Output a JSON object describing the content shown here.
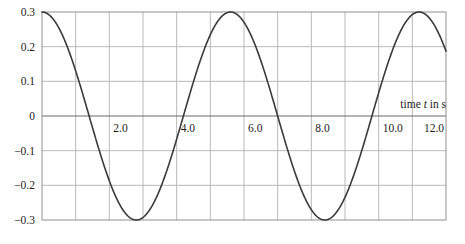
{
  "chart_data": {
    "type": "line",
    "title": "",
    "subtitle": "",
    "xlabel": "time t in s",
    "ylabel": "",
    "xlim": [
      0,
      12
    ],
    "ylim": [
      -0.3,
      0.3
    ],
    "grid": true,
    "legend": "none",
    "x_major_step": 2.0,
    "x_minor_step": 1.0,
    "y_step": 0.1,
    "zero_line": true,
    "xticks": [
      0,
      2.0,
      4.0,
      6.0,
      8.0,
      10.0,
      12.0
    ],
    "xtick_labels": [
      "",
      "2.0",
      "4.0",
      "6.0",
      "8.0",
      "10.0",
      "12.0"
    ],
    "yticks": [
      0.3,
      0.2,
      0.1,
      0,
      -0.1,
      -0.2,
      -0.3
    ],
    "ytick_labels": [
      "0.3",
      "0.2",
      "0.1",
      "0",
      "−0.1",
      "−0.2",
      "−0.3"
    ],
    "series": [
      {
        "name": "displacement",
        "form": "cosine",
        "amplitude": 0.3,
        "period": 5.6,
        "phase": 0,
        "offset": 0,
        "color": "#3a3a3a",
        "width": 1.6,
        "x": [
          0.0,
          0.2,
          0.4,
          0.6,
          0.8,
          1.0,
          1.2,
          1.4,
          1.6,
          1.8,
          2.0,
          2.2,
          2.4,
          2.6,
          2.8,
          3.0,
          3.2,
          3.4,
          3.6,
          3.8,
          4.0,
          4.2,
          4.4,
          4.6,
          4.8,
          5.0,
          5.2,
          5.4,
          5.6,
          5.8,
          6.0,
          6.2,
          6.4,
          6.6,
          6.8,
          7.0,
          7.2,
          7.4,
          7.6,
          7.8,
          8.0,
          8.2,
          8.4,
          8.6,
          8.8,
          9.0,
          9.2,
          9.4,
          9.6,
          9.8,
          10.0,
          10.2,
          10.4,
          10.6,
          10.8,
          11.0,
          11.2,
          11.4,
          11.6,
          11.8,
          12.0
        ],
        "y": [
          0.3,
          0.294,
          0.277,
          0.25,
          0.213,
          0.169,
          0.118,
          0.063,
          0.006,
          -0.051,
          -0.106,
          -0.157,
          -0.202,
          -0.24,
          -0.27,
          -0.29,
          -0.299,
          -0.298,
          -0.286,
          -0.264,
          -0.232,
          -0.192,
          -0.145,
          -0.093,
          -0.038,
          0.019,
          0.076,
          0.13,
          0.179,
          0.221,
          0.255,
          0.28,
          0.295,
          0.3,
          0.294,
          0.277,
          0.25,
          0.213,
          0.169,
          0.118,
          0.063,
          0.006,
          -0.051,
          -0.106,
          -0.157,
          -0.202,
          -0.24,
          -0.27,
          -0.29,
          -0.299,
          -0.298,
          -0.286,
          -0.264,
          -0.232,
          -0.192,
          -0.145,
          -0.093,
          -0.038,
          0.019,
          0.076,
          0.13
        ]
      }
    ],
    "key_points": {
      "maxima_t": [
        0.0,
        5.6,
        11.2
      ],
      "minima_t": [
        2.8,
        8.4
      ],
      "zero_crossings_t": [
        1.4,
        4.2,
        7.0,
        9.8
      ],
      "max_value": 0.3,
      "min_value": -0.3
    },
    "colors": {
      "curve": "#3a3a3a",
      "grid": "#b9b9b9",
      "zero_axis": "#6b6b6b",
      "frame": "#9a9a9a",
      "text": "#1c1c1c",
      "background": "#ffffff"
    }
  },
  "caption": {
    "prefix": "time ",
    "symbol": "t",
    "suffix": " in s"
  }
}
